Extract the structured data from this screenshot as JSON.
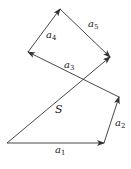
{
  "diagram": {
    "type": "vector-polygon",
    "color": "#333333",
    "points": {
      "O": [
        7,
        143
      ],
      "P1": [
        104,
        143
      ],
      "P2": [
        119,
        97
      ],
      "P3": [
        28,
        52
      ],
      "P4": [
        60,
        9
      ],
      "P5": [
        110,
        57
      ]
    },
    "vectors": [
      {
        "id": "a1",
        "label": "a",
        "sub": "1",
        "from": "O",
        "to": "P1"
      },
      {
        "id": "a2",
        "label": "a",
        "sub": "2",
        "from": "P1",
        "to": "P2"
      },
      {
        "id": "a3",
        "label": "a",
        "sub": "3",
        "from": "P2",
        "to": "P3"
      },
      {
        "id": "a4",
        "label": "a",
        "sub": "4",
        "from": "P3",
        "to": "P4"
      },
      {
        "id": "a5",
        "label": "a",
        "sub": "5",
        "from": "P4",
        "to": "P5"
      },
      {
        "id": "S",
        "label": "S",
        "sub": "",
        "from": "O",
        "to": "P5"
      }
    ]
  }
}
